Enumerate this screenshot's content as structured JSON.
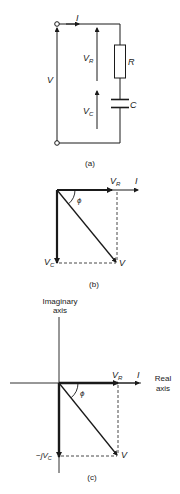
{
  "figure_a": {
    "caption": "(a)",
    "current_label": "I",
    "source_voltage_label": "V",
    "resistor_voltage_label": "V",
    "resistor_voltage_sub": "R",
    "capacitor_voltage_label": "V",
    "capacitor_voltage_sub": "C",
    "resistor_label": "R",
    "capacitor_label": "C"
  },
  "figure_b": {
    "caption": "(b)",
    "vr_label": "V",
    "vr_sub": "R",
    "current_label": "I",
    "angle_label": "ϕ",
    "vc_label": "V",
    "vc_sub": "C",
    "v_label": "V"
  },
  "figure_c": {
    "caption": "(c)",
    "imag_axis_line1": "Imaginary",
    "imag_axis_line2": "axis",
    "real_axis_line1": "Real",
    "real_axis_line2": "axis",
    "vr_label": "V",
    "vr_sub": "R",
    "current_label": "I",
    "angle_label": "ϕ",
    "vc_prefix": "−jV",
    "vc_sub": "C",
    "v_label": "V"
  },
  "colors": {
    "line": "#1a1a1a",
    "background": "#ffffff"
  }
}
